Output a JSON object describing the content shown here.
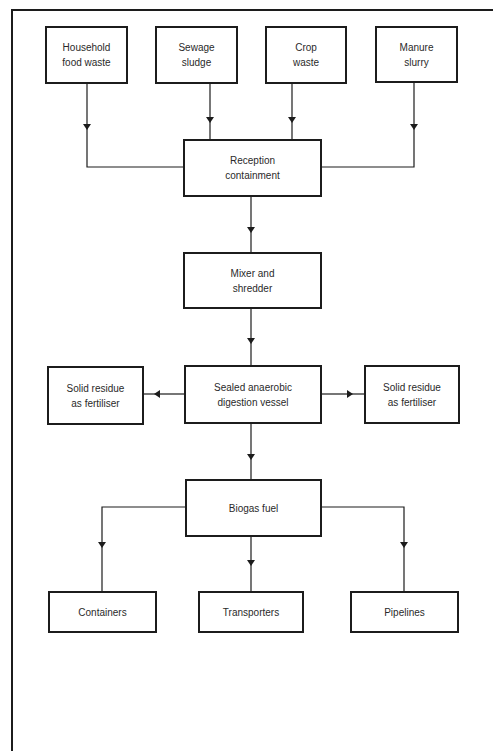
{
  "diagram": {
    "title": "",
    "inputs": [
      {
        "label": "Household\nfood waste"
      },
      {
        "label": "Sewage\nsludge"
      },
      {
        "label": "Crop\nwaste"
      },
      {
        "label": "Manure\nslurry"
      }
    ],
    "reception": {
      "label": "Reception\ncontainment"
    },
    "mixer": {
      "label": "Mixer and\nshredder"
    },
    "digester": {
      "label": "Sealed anaerobic\ndigestion vessel"
    },
    "residue_left": {
      "label": "Solid residue\nas fertiliser"
    },
    "residue_right": {
      "label": "Solid residue\nas fertiliser"
    },
    "biogas": {
      "label": "Biogas fuel"
    },
    "outputs": [
      {
        "label": "Containers"
      },
      {
        "label": "Transporters"
      },
      {
        "label": "Pipelines"
      }
    ],
    "line_color": "#1c1c1c"
  }
}
